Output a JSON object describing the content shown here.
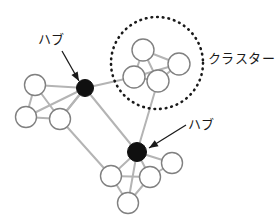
{
  "diagram": {
    "type": "network-graph",
    "width": 275,
    "height": 222,
    "background_color": "#ffffff",
    "edge_color": "#b4b4b4",
    "node_fill_color": "#ffffff",
    "node_stroke_color": "#808080",
    "hub_fill_color": "#101010",
    "annotation_color": "#1a1a1a"
  },
  "labels": {
    "hub_1": "ハブ",
    "hub_2": "ハブ",
    "cluster": "クラスター"
  },
  "chart_data": {
    "type": "scatter",
    "title": "",
    "xlabel": "",
    "ylabel": "",
    "nodes": [
      {
        "id": "L1",
        "x": 35,
        "y": 85,
        "r": 10.5,
        "kind": "normal",
        "group": "left-group"
      },
      {
        "id": "L2",
        "x": 26,
        "y": 117,
        "r": 10.5,
        "kind": "normal",
        "group": "left-group"
      },
      {
        "id": "L3",
        "x": 60,
        "y": 119,
        "r": 10.5,
        "kind": "normal",
        "group": "left-group"
      },
      {
        "id": "H1",
        "x": 85,
        "y": 88,
        "r": 8.5,
        "kind": "hub",
        "group": "hub"
      },
      {
        "id": "C1",
        "x": 143,
        "y": 50,
        "r": 11,
        "kind": "normal",
        "group": "cluster"
      },
      {
        "id": "C2",
        "x": 179,
        "y": 64,
        "r": 11,
        "kind": "normal",
        "group": "cluster"
      },
      {
        "id": "C3",
        "x": 134,
        "y": 77,
        "r": 11,
        "kind": "normal",
        "group": "cluster"
      },
      {
        "id": "C4",
        "x": 158,
        "y": 81,
        "r": 11,
        "kind": "normal",
        "group": "cluster"
      },
      {
        "id": "H2",
        "x": 137,
        "y": 152,
        "r": 9.5,
        "kind": "hub",
        "group": "hub"
      },
      {
        "id": "B1",
        "x": 111,
        "y": 176,
        "r": 10.5,
        "kind": "normal",
        "group": "bottom-group"
      },
      {
        "id": "B2",
        "x": 150,
        "y": 177,
        "r": 10.5,
        "kind": "normal",
        "group": "bottom-group"
      },
      {
        "id": "B3",
        "x": 172,
        "y": 163,
        "r": 10.5,
        "kind": "normal",
        "group": "bottom-group"
      },
      {
        "id": "B4",
        "x": 128,
        "y": 203,
        "r": 10.5,
        "kind": "normal",
        "group": "bottom-group"
      }
    ],
    "edges": [
      [
        "L1",
        "L2"
      ],
      [
        "L1",
        "L3"
      ],
      [
        "L2",
        "L3"
      ],
      [
        "L1",
        "H1"
      ],
      [
        "L2",
        "H1"
      ],
      [
        "L3",
        "H1"
      ],
      [
        "H1",
        "C3"
      ],
      [
        "H1",
        "H2"
      ],
      [
        "H1",
        "L3"
      ],
      [
        "C1",
        "C2"
      ],
      [
        "C1",
        "C3"
      ],
      [
        "C1",
        "C4"
      ],
      [
        "C2",
        "C3"
      ],
      [
        "C2",
        "C4"
      ],
      [
        "C3",
        "C4"
      ],
      [
        "C4",
        "H2"
      ],
      [
        "L3",
        "B1"
      ],
      [
        "H2",
        "B1"
      ],
      [
        "H2",
        "B2"
      ],
      [
        "H2",
        "B3"
      ],
      [
        "H2",
        "B4"
      ],
      [
        "B1",
        "B2"
      ],
      [
        "B1",
        "B4"
      ],
      [
        "B2",
        "B3"
      ],
      [
        "B2",
        "B4"
      ]
    ],
    "cluster_ring": {
      "cx": 157,
      "cy": 63,
      "r": 46,
      "style": "dotted"
    },
    "annotations": [
      {
        "label_key": "hub_1",
        "from_x": 62,
        "from_y": 51,
        "to_x": 79,
        "to_y": 81
      },
      {
        "label_key": "hub_2",
        "from_x": 186,
        "from_y": 125,
        "to_x": 149,
        "to_y": 148
      },
      {
        "label_key": "cluster",
        "from_x": 0,
        "from_y": 0,
        "to_x": 0,
        "to_y": 0
      }
    ]
  }
}
